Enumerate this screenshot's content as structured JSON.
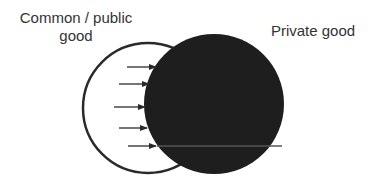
{
  "diagram": {
    "labels": {
      "common_line1": "Common / public",
      "common_line2": "good",
      "private": "Private good"
    },
    "colors": {
      "background": "#ffffff",
      "outline": "#2a2a2a",
      "private_fill": "#1e1e1e",
      "text": "#333333"
    },
    "shapes": {
      "common_circle": {
        "cx": 148,
        "cy": 108,
        "r": 65,
        "fill": "none"
      },
      "private_circle": {
        "cx": 214,
        "cy": 104,
        "r": 70,
        "fill": "dark"
      }
    },
    "arrows": [
      {
        "y": 67,
        "x1": 127,
        "x2": 156
      },
      {
        "y": 84,
        "x1": 119,
        "x2": 149
      },
      {
        "y": 107,
        "x1": 114,
        "x2": 145
      },
      {
        "y": 128,
        "x1": 119,
        "x2": 147
      },
      {
        "y": 146,
        "x1": 128,
        "x2": 156
      }
    ],
    "arrow_direction": "pointing right, from common good into private good"
  }
}
